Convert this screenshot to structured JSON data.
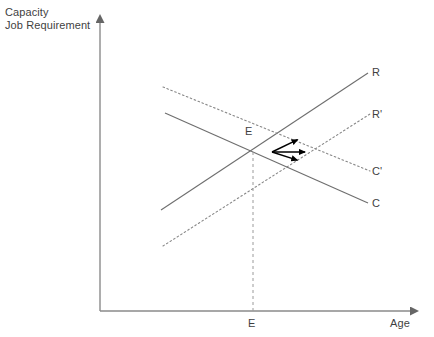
{
  "figure": {
    "background_color": "#ffffff",
    "axis_color": "#808080",
    "line_color": "#6e6e6e",
    "arrow_color": "#000000",
    "text_color": "#3f3f3f"
  },
  "axes": {
    "y_axis_caption_line1": "Capacity",
    "y_axis_caption_line2": "Job Requirement",
    "x_axis_label": "Age",
    "origin": {
      "x": 100,
      "y": 311
    },
    "y_axis_tip": {
      "x": 100,
      "y": 13
    },
    "x_axis_tip": {
      "x": 420,
      "y": 311
    }
  },
  "curves": [
    {
      "id": "R",
      "label": "R",
      "style": "solid",
      "direction": "upward",
      "x1": 161,
      "y1": 210,
      "x2": 368,
      "y2": 73
    },
    {
      "id": "Rprime",
      "label": "R'",
      "style": "dotted",
      "direction": "upward",
      "x1": 163,
      "y1": 246,
      "x2": 370,
      "y2": 114
    },
    {
      "id": "Cprime",
      "label": "C'",
      "style": "dotted",
      "direction": "downward",
      "x1": 163,
      "y1": 87,
      "x2": 370,
      "y2": 171
    },
    {
      "id": "C",
      "label": "C",
      "style": "solid",
      "direction": "downward",
      "x1": 165,
      "y1": 113,
      "x2": 368,
      "y2": 203
    }
  ],
  "equilibrium": {
    "label": "E",
    "axis_label": "E",
    "point": {
      "x": 253,
      "y": 152
    },
    "dropline_style": "dashed",
    "dropline_to_y": 311
  },
  "shift_arrows": {
    "vertex": {
      "x": 272,
      "y": 152
    },
    "arrows": [
      {
        "id": "arrow-up-right",
        "tip_x": 303,
        "tip_y": 137
      },
      {
        "id": "arrow-right",
        "tip_x": 311,
        "tip_y": 152
      },
      {
        "id": "arrow-down-right",
        "tip_x": 303,
        "tip_y": 162
      }
    ]
  },
  "chart_data": {
    "type": "line",
    "title": "",
    "xlabel": "Age",
    "ylabel": "Capacity\nJob Requirement",
    "grid": false,
    "legend": "inline-endpoint-labels",
    "annotations": [
      {
        "text": "E",
        "role": "equilibrium-intersection"
      },
      {
        "text": "E",
        "role": "equilibrium-on-x-axis"
      },
      {
        "text": "shift-arrows",
        "role": "three-rightward-arrows-from-equilibrium"
      }
    ],
    "series": [
      {
        "name": "R",
        "style": "solid",
        "description": "Job requirement rising with age",
        "x": [
          161,
          368
        ],
        "y": [
          210,
          73
        ]
      },
      {
        "name": "R'",
        "style": "dotted",
        "description": "Shifted job requirement curve",
        "x": [
          163,
          370
        ],
        "y": [
          246,
          114
        ]
      },
      {
        "name": "C'",
        "style": "dotted",
        "description": "Shifted capacity curve",
        "x": [
          163,
          370
        ],
        "y": [
          87,
          171
        ]
      },
      {
        "name": "C",
        "style": "solid",
        "description": "Capacity declining with age",
        "x": [
          165,
          368
        ],
        "y": [
          113,
          203
        ]
      }
    ]
  }
}
